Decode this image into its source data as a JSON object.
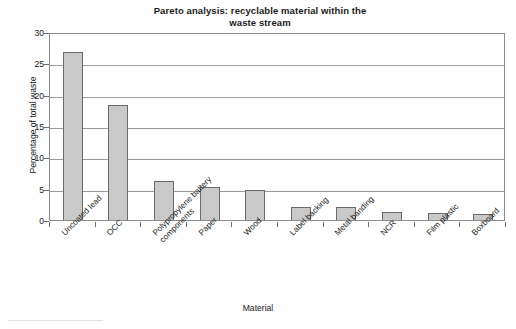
{
  "chart_data": {
    "type": "bar",
    "title": "Pareto analysis: recyclable material within the waste stream",
    "title_line1": "Pareto analysis: recyclable material within the",
    "title_line2": "waste stream",
    "xlabel": "Material",
    "ylabel": "Percentage of total waste",
    "ylim": [
      0,
      30
    ],
    "yticks": [
      0,
      5,
      10,
      15,
      20,
      25,
      30
    ],
    "ytick_labels": [
      "0",
      "5",
      "10",
      "15",
      "20",
      "25",
      "30"
    ],
    "grid": true,
    "legend": "none",
    "categories": [
      "Uncoated lead",
      "OCC",
      "Polypropylene battery components",
      "Paper",
      "Wood",
      "Label backing",
      "Metal banding",
      "NCR",
      "Film plastic",
      "Boxboard"
    ],
    "category_lines": [
      [
        "Uncoated lead"
      ],
      [
        "OCC"
      ],
      [
        "Polypropylene battery",
        "components"
      ],
      [
        "Paper"
      ],
      [
        "Wood"
      ],
      [
        "Label backing"
      ],
      [
        "Metal banding"
      ],
      [
        "NCR"
      ],
      [
        "Film plastic"
      ],
      [
        "Boxboard"
      ]
    ],
    "values": [
      26.8,
      18.4,
      6.2,
      5.2,
      4.8,
      2.1,
      2.0,
      1.2,
      1.1,
      1.0
    ],
    "bar_fill": "#c9c9c9",
    "bar_stroke": "#6b6b6b",
    "axis_color": "#8d8d8d",
    "grid_color": "#9a9a9a"
  }
}
